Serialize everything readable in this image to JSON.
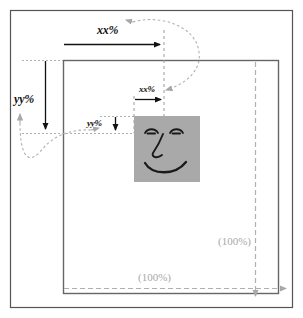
{
  "diagram": {
    "colors": {
      "outer_frame": "#555555",
      "box_border": "#666666",
      "arrow_black": "#111111",
      "guide_gray": "#b0b0b0",
      "label_gray": "#a8a8a8",
      "face_fill": "#a9a9a9",
      "face_stroke": "#1a1a1a",
      "background": "#ffffff"
    },
    "labels": {
      "xx_top": "xx%",
      "xx_inner": "xx%",
      "yy_left": "yy%",
      "yy_inner": "yy%",
      "width_100": "(100%)",
      "height_100": "(100%)"
    },
    "elements": {
      "outer_frame_name": "outer-frame",
      "container_box_name": "container-box",
      "face_tile_name": "face-tile",
      "top_measure_arrow": "xx-percent-top-arrow",
      "left_measure_arrow": "yy-percent-left-arrow",
      "inner_x_arrow": "xx-percent-inner-arrow",
      "inner_y_arrow": "yy-percent-inner-arrow",
      "width_dashed_arrow": "container-width-arrow",
      "height_dashed_arrow": "container-height-arrow",
      "curve_x": "xx-percent-mapping-curve",
      "curve_y": "yy-percent-mapping-curve"
    }
  }
}
